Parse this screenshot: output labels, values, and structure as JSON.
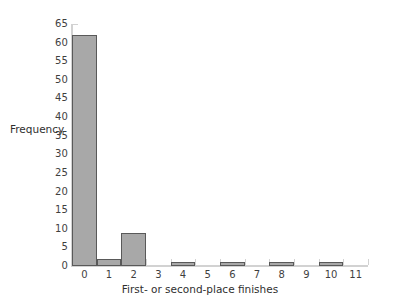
{
  "chart_data": {
    "type": "bar",
    "title": "",
    "xlabel": "First- or second-place finishes",
    "ylabel": "Frequency",
    "categories": [
      "0",
      "1",
      "2",
      "3",
      "4",
      "5",
      "6",
      "7",
      "8",
      "9",
      "10",
      "11"
    ],
    "values": [
      62,
      2,
      9,
      0,
      1,
      0,
      1,
      0,
      1,
      0,
      1,
      0
    ],
    "xlim": [
      -0.5,
      11.5
    ],
    "ylim": [
      0,
      65
    ],
    "ytick_labels": [
      "0",
      "5",
      "10",
      "15",
      "20",
      "25",
      "30",
      "35",
      "40",
      "45",
      "50",
      "55",
      "60",
      "65"
    ],
    "ytick_values": [
      0,
      5,
      10,
      15,
      20,
      25,
      30,
      35,
      40,
      45,
      50,
      55,
      60,
      65
    ],
    "xtick_labels": [
      "0",
      "1",
      "2",
      "3",
      "4",
      "5",
      "6",
      "7",
      "8",
      "9",
      "10",
      "11"
    ],
    "xtick_values": [
      0,
      1,
      2,
      3,
      4,
      5,
      6,
      7,
      8,
      9,
      10,
      11
    ],
    "grid": false,
    "legend": null,
    "bar_width": 1,
    "colors": {
      "background": "#ffffff",
      "bar_fill": "#a8a8a8",
      "bar_edge": "#595959",
      "axis": "#d2d2d2",
      "text": "#3a3a3a"
    }
  }
}
